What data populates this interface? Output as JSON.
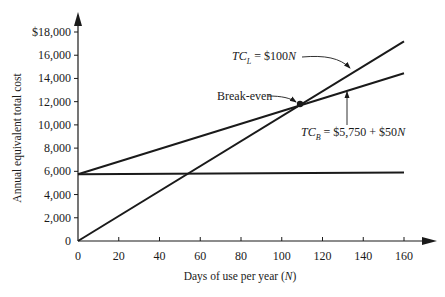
{
  "chart_data": {
    "type": "line",
    "title": "",
    "xlabel": "Days of use per year (N)",
    "xlabel_parts": {
      "text": "Days of use per year (",
      "var": "N",
      "close": ")"
    },
    "ylabel": "Annual equivalent total cost",
    "xlim": [
      0,
      160
    ],
    "ylim": [
      0,
      18000
    ],
    "grid": false,
    "legend": "none (inline annotations)",
    "x_ticks": [
      0,
      20,
      40,
      60,
      80,
      100,
      120,
      140,
      160
    ],
    "x_tick_labels": [
      "0",
      "20",
      "40",
      "60",
      "80",
      "100",
      "120",
      "140",
      "160"
    ],
    "y_ticks": [
      0,
      2000,
      4000,
      6000,
      8000,
      10000,
      12000,
      14000,
      16000,
      18000
    ],
    "y_tick_labels": [
      "0",
      "2,000",
      "4,000",
      "6,000",
      "8,000",
      "10,000",
      "12,000",
      "14,000",
      "16,000",
      "$18,000"
    ],
    "series": [
      {
        "name": "TC_L = $100N",
        "x": [
          0,
          160
        ],
        "values": [
          0,
          17200
        ],
        "formula": "100N"
      },
      {
        "name": "TC_B = $5,750 + $50N",
        "x": [
          0,
          160
        ],
        "values": [
          5750,
          14450
        ],
        "formula": "5750 + 50N"
      },
      {
        "name": "Fixed cost",
        "x": [
          0,
          160
        ],
        "values": [
          5750,
          5900
        ]
      }
    ],
    "annotations": [
      {
        "text": "Break-even",
        "x": 109,
        "y": 11800
      },
      {
        "text": "TC_L = $100N",
        "points_to": "TC_L line"
      },
      {
        "text": "TC_B = $5,750 + $50N",
        "points_to": "TC_B line"
      }
    ]
  },
  "labels": {
    "tcl_main": "TC",
    "tcl_sub": "L",
    "tcl_rest": " = $100",
    "tcl_var": "N",
    "tcb_main": "TC",
    "tcb_sub": "B",
    "tcb_rest": " = $5,750 + $50",
    "tcb_var": "N",
    "breakeven": "Break-even"
  },
  "colors": {
    "ink": "#1a1a1a",
    "background": "#ffffff"
  }
}
